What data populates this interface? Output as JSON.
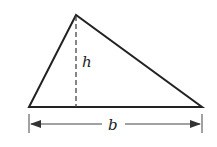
{
  "diagram": {
    "type": "triangle-area",
    "labels": {
      "height": "h",
      "base": "b"
    },
    "colors": {
      "stroke": "#222222",
      "background": "#ffffff"
    }
  }
}
